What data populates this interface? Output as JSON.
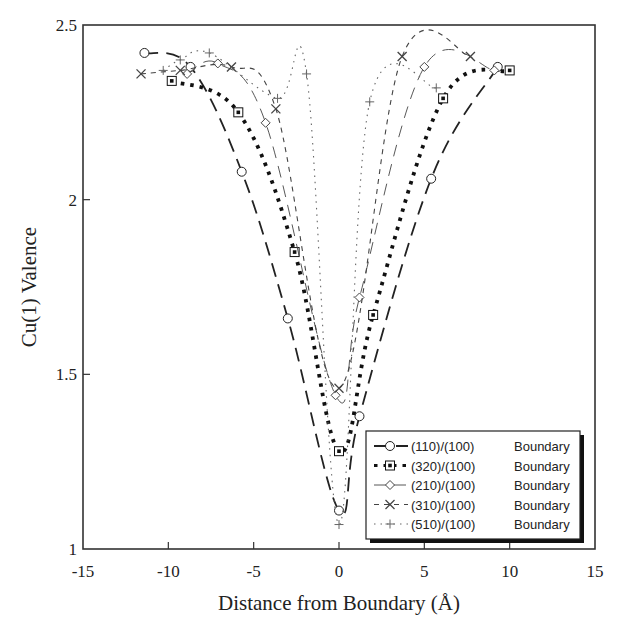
{
  "chart_data": {
    "type": "line",
    "title": "",
    "xlabel": "Distance from Boundary (Å)",
    "ylabel": "Cu(1) Valence",
    "xlim": [
      -15,
      15
    ],
    "ylim": [
      1,
      2.5
    ],
    "xticks": [
      -15,
      -10,
      -5,
      0,
      5,
      10,
      15
    ],
    "yticks": [
      1,
      1.5,
      2,
      2.5
    ],
    "xtick_labels": [
      "-15",
      "-10",
      "-5",
      "0",
      "5",
      "10",
      "15"
    ],
    "ytick_labels": [
      "1",
      "1.5",
      "2",
      "2.5"
    ],
    "grid": false,
    "legend_position": "lower right",
    "series": [
      {
        "name": "(110)/(100)",
        "suffix": "Boundary",
        "marker": "circle",
        "line_style": "long-dash",
        "x": [
          -11.4,
          -8.7,
          -5.7,
          -3.0,
          0.0,
          1.2,
          5.4,
          9.3
        ],
        "y": [
          2.42,
          2.38,
          2.08,
          1.66,
          1.11,
          1.38,
          2.06,
          2.38
        ]
      },
      {
        "name": "(320)/(100)",
        "suffix": "Boundary",
        "marker": "square",
        "line_style": "heavy-dotted",
        "x": [
          -9.8,
          -5.9,
          -2.6,
          0.0,
          2.0,
          6.1,
          10.0
        ],
        "y": [
          2.34,
          2.25,
          1.85,
          1.28,
          1.67,
          2.29,
          2.37
        ]
      },
      {
        "name": "(210)/(100)",
        "suffix": "Boundary",
        "marker": "diamond",
        "line_style": "thin-dash",
        "x": [
          -8.9,
          -7.1,
          -4.3,
          -0.2,
          1.2,
          5.0,
          9.1
        ],
        "y": [
          2.36,
          2.39,
          2.22,
          1.44,
          1.72,
          2.38,
          2.37
        ]
      },
      {
        "name": "(310)/(100)",
        "suffix": "Boundary",
        "marker": "x",
        "line_style": "short-dash",
        "x": [
          -11.6,
          -9.3,
          -6.3,
          -3.7,
          0.0,
          3.7,
          7.7
        ],
        "y": [
          2.36,
          2.37,
          2.38,
          2.26,
          1.46,
          2.41,
          2.41
        ]
      },
      {
        "name": "(510)/(100)",
        "suffix": "Boundary",
        "marker": "plus",
        "line_style": "dotted",
        "x": [
          -10.3,
          -9.3,
          -7.6,
          -3.6,
          -1.9,
          0.0,
          1.8,
          5.7
        ],
        "y": [
          2.37,
          2.4,
          2.42,
          2.29,
          2.36,
          1.07,
          2.28,
          2.32
        ]
      }
    ]
  }
}
